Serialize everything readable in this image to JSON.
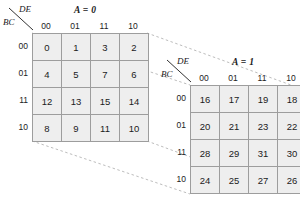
{
  "figure": {
    "title": "",
    "background_color": "#ffffff",
    "cell_fill": "#eeeeee",
    "grid_line_color": "#9d9d9d",
    "connector_color": "#b5b5b5"
  },
  "maps": [
    {
      "id": "map-a0",
      "title": "A = 0",
      "corner_row_label": "BC",
      "corner_col_label": "DE",
      "col_headers": [
        "00",
        "01",
        "11",
        "10"
      ],
      "row_headers": [
        "00",
        "01",
        "11",
        "10"
      ],
      "rows": [
        [
          "0",
          "1",
          "3",
          "2"
        ],
        [
          "4",
          "5",
          "7",
          "6"
        ],
        [
          "12",
          "13",
          "15",
          "14"
        ],
        [
          "8",
          "9",
          "11",
          "10"
        ]
      ]
    },
    {
      "id": "map-a1",
      "title": "A = 1",
      "corner_row_label": "BC",
      "corner_col_label": "DE",
      "col_headers": [
        "00",
        "01",
        "11",
        "10"
      ],
      "row_headers": [
        "00",
        "01",
        "11",
        "10"
      ],
      "rows": [
        [
          "16",
          "17",
          "19",
          "18"
        ],
        [
          "20",
          "21",
          "23",
          "22"
        ],
        [
          "28",
          "29",
          "31",
          "30"
        ],
        [
          "24",
          "25",
          "27",
          "26"
        ]
      ]
    }
  ]
}
